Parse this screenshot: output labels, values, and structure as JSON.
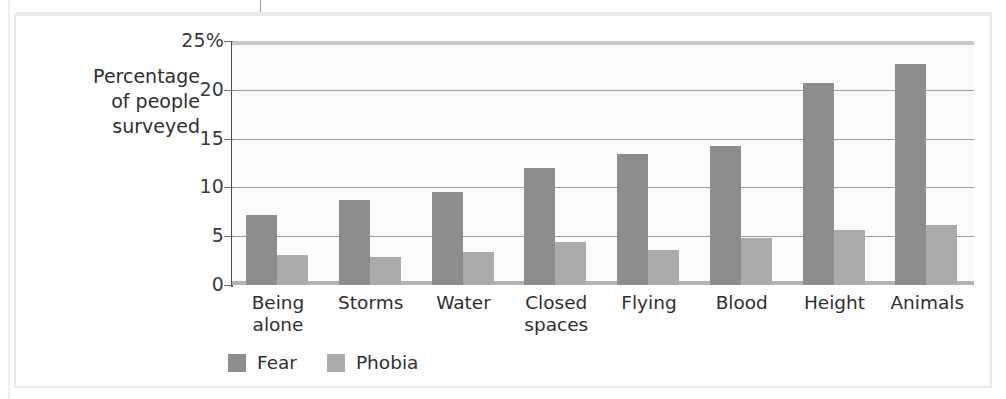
{
  "figure": {
    "axis_title_lines": [
      "Percentage",
      "of people",
      "surveyed"
    ],
    "axis_title": "Percentage of people surveyed"
  },
  "legend": {
    "items": [
      {
        "label": "Fear",
        "color": "#8d8d8d",
        "swatch_name": "legend-swatch-fear"
      },
      {
        "label": "Phobia",
        "color": "#ababab",
        "swatch_name": "legend-swatch-phobia"
      }
    ]
  },
  "chart_data": {
    "type": "bar",
    "title": "",
    "xlabel": "",
    "ylabel": "Percentage of people surveyed",
    "ylim": [
      0,
      25
    ],
    "yticks": [
      0,
      5,
      10,
      15,
      20,
      25
    ],
    "ytick_labels": [
      "0",
      "5",
      "10",
      "15",
      "20",
      "25%"
    ],
    "grid": true,
    "legend_position": "bottom-left",
    "categories": [
      "Being alone",
      "Storms",
      "Water",
      "Closed spaces",
      "Flying",
      "Blood",
      "Height",
      "Animals"
    ],
    "category_label_lines": [
      [
        "Being",
        "alone"
      ],
      [
        "Storms"
      ],
      [
        "Water"
      ],
      [
        "Closed",
        "spaces"
      ],
      [
        "Flying"
      ],
      [
        "Blood"
      ],
      [
        "Height"
      ],
      [
        "Animals"
      ]
    ],
    "series": [
      {
        "name": "Fear",
        "color": "#8d8d8d",
        "values": [
          7.2,
          8.7,
          9.5,
          12.0,
          13.4,
          14.2,
          20.7,
          22.6
        ]
      },
      {
        "name": "Phobia",
        "color": "#ababab",
        "values": [
          3.1,
          2.9,
          3.4,
          4.4,
          3.6,
          4.8,
          5.6,
          6.1
        ]
      }
    ]
  }
}
